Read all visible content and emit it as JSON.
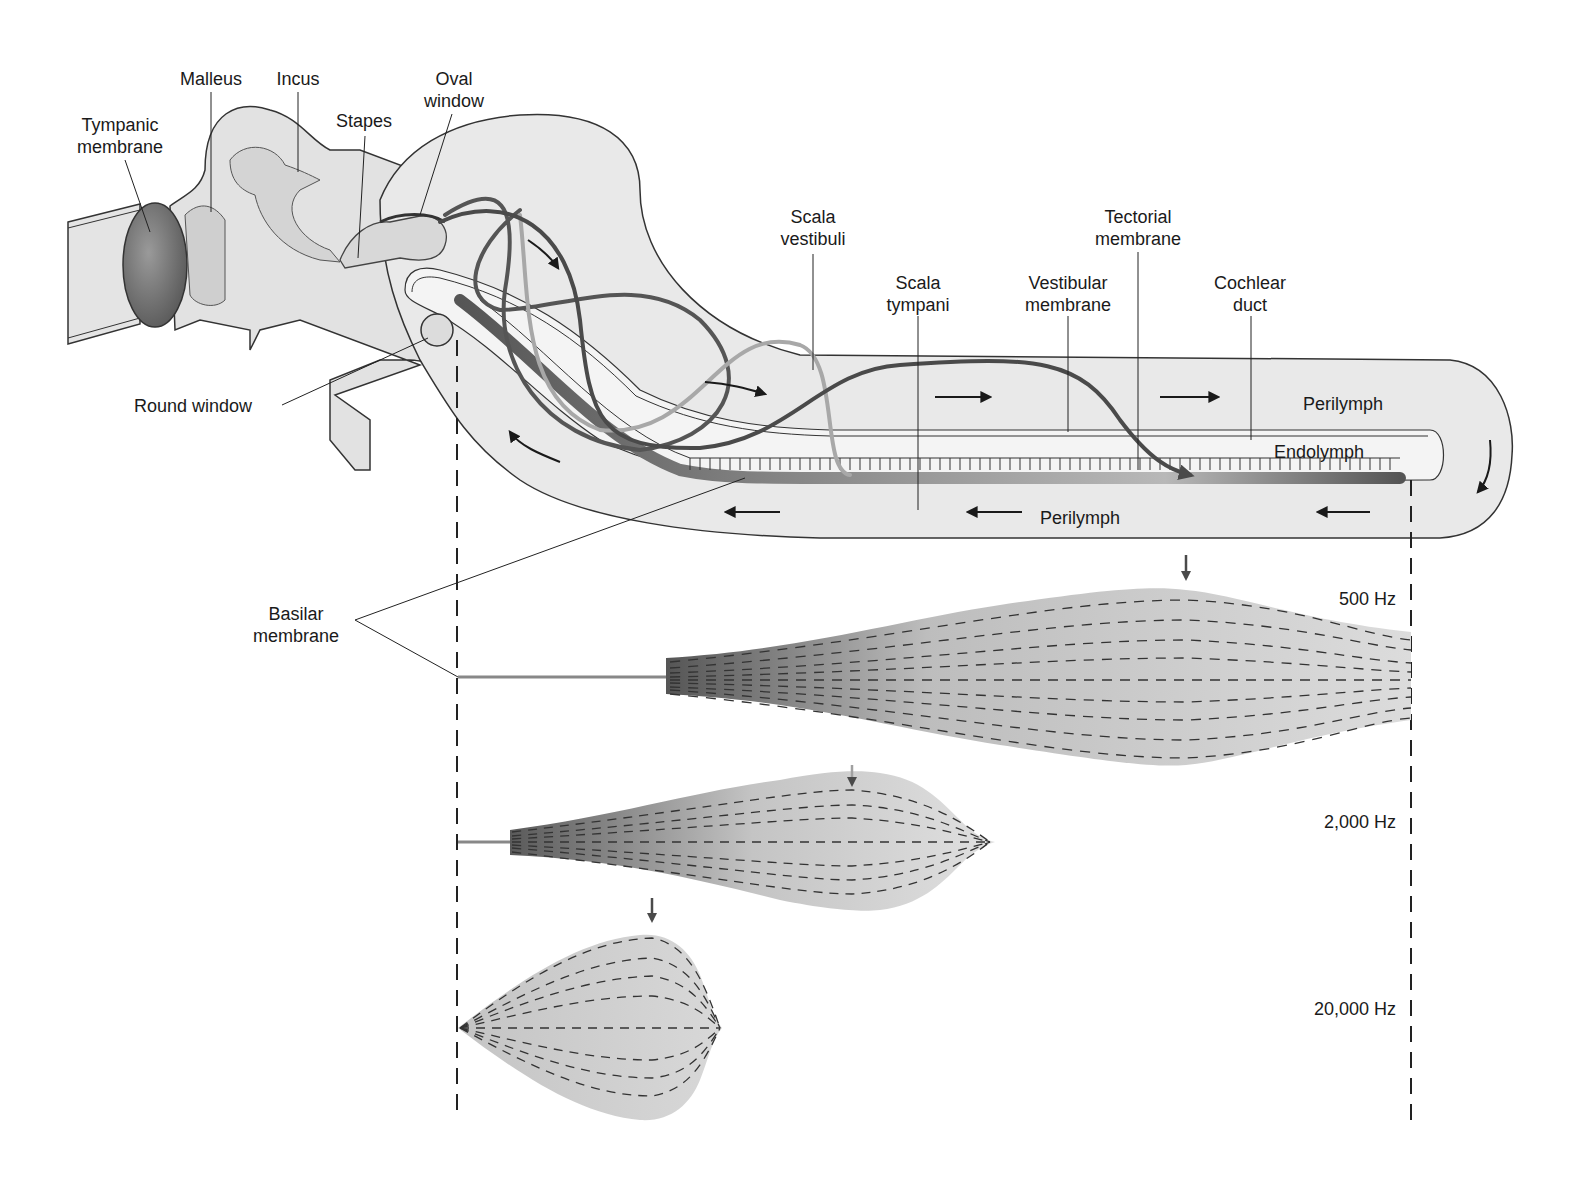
{
  "figure": {
    "colors": {
      "background": "#ffffff",
      "tissue_fill": "#e6e6e6",
      "outline": "#333333",
      "wave_dark": "#4a4a4a",
      "wave_light": "#a8a8a8",
      "membrane_dark": "#5c5c5c"
    }
  },
  "labels": {
    "tympanic_membrane": "Tympanic\nmembrane",
    "malleus": "Malleus",
    "incus": "Incus",
    "stapes": "Stapes",
    "oval_window": "Oval\nwindow",
    "round_window": "Round window",
    "scala_vestibuli": "Scala\nvestibuli",
    "scala_tympani": "Scala\ntympani",
    "vestibular_membrane": "Vestibular\nmembrane",
    "tectorial_membrane": "Tectorial\nmembrane",
    "cochlear_duct": "Cochlear\nduct",
    "perilymph_top": "Perilymph",
    "endolymph": "Endolymph",
    "perilymph_bottom": "Perilymph",
    "basilar_membrane": "Basilar\nmembrane"
  },
  "waves": [
    {
      "frequency": "500 Hz",
      "peak_position": "near apex",
      "arrow_color": "#4a4a4a"
    },
    {
      "frequency": "2,000 Hz",
      "peak_position": "middle",
      "arrow_color": "#a0a0a0"
    },
    {
      "frequency": "20,000 Hz",
      "peak_position": "near base",
      "arrow_color": "#4a4a4a"
    }
  ],
  "icons": {
    "flow_arrow": "arrow-right",
    "peak_marker": "arrow-down"
  }
}
